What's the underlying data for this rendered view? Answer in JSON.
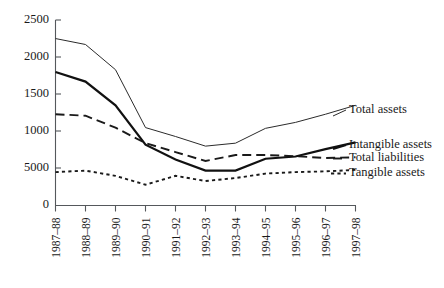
{
  "chart_data": {
    "type": "line",
    "title": "",
    "xlabel": "",
    "ylabel": "",
    "grid": false,
    "legend_position": "right-inline-labels",
    "categories": [
      "1987–88",
      "1988–89",
      "1989–90",
      "1990–91",
      "1991–92",
      "1992–93",
      "1993–94",
      "1994–95",
      "1995–96",
      "1996–97",
      "1997–98"
    ],
    "ylim": [
      0,
      2500
    ],
    "ytick_labels": [
      "2500",
      "2000",
      "1500",
      "1000",
      "5000",
      "0"
    ],
    "ytick_values": [
      2500,
      2000,
      1500,
      1000,
      500,
      0
    ],
    "series": [
      {
        "name": "Total assets",
        "style": "thin-solid",
        "values": [
          2250,
          2170,
          1830,
          1050,
          930,
          800,
          840,
          1040,
          1120,
          1230,
          1350
        ]
      },
      {
        "name": "Intangible assets",
        "style": "thick-solid",
        "values": [
          1800,
          1670,
          1350,
          820,
          620,
          470,
          470,
          630,
          660,
          760,
          850
        ]
      },
      {
        "name": "Total liabilities",
        "style": "long-dash",
        "values": [
          1230,
          1210,
          1050,
          840,
          720,
          600,
          680,
          680,
          665,
          640,
          650
        ]
      },
      {
        "name": "Tangible assets",
        "style": "short-dash",
        "values": [
          450,
          470,
          400,
          280,
          400,
          330,
          370,
          430,
          450,
          460,
          480
        ]
      }
    ]
  },
  "legend": {
    "items": [
      {
        "label": "Total assets"
      },
      {
        "label": "Intangible assets"
      },
      {
        "label": "Total liabilities"
      },
      {
        "label": "Tangible assets"
      }
    ]
  },
  "axes": {
    "y_labels": [
      "2500",
      "2000",
      "1500",
      "1000",
      "5000",
      "0"
    ],
    "x_labels": [
      "1987–88",
      "1988–89",
      "1989–90",
      "1990–91",
      "1991–92",
      "1992–93",
      "1993–94",
      "1994–95",
      "1995–96",
      "1996–97",
      "1997–98"
    ]
  },
  "colors": {
    "axis": "#55585c",
    "ink": "#1a1a1a",
    "background": "#ffffff"
  }
}
